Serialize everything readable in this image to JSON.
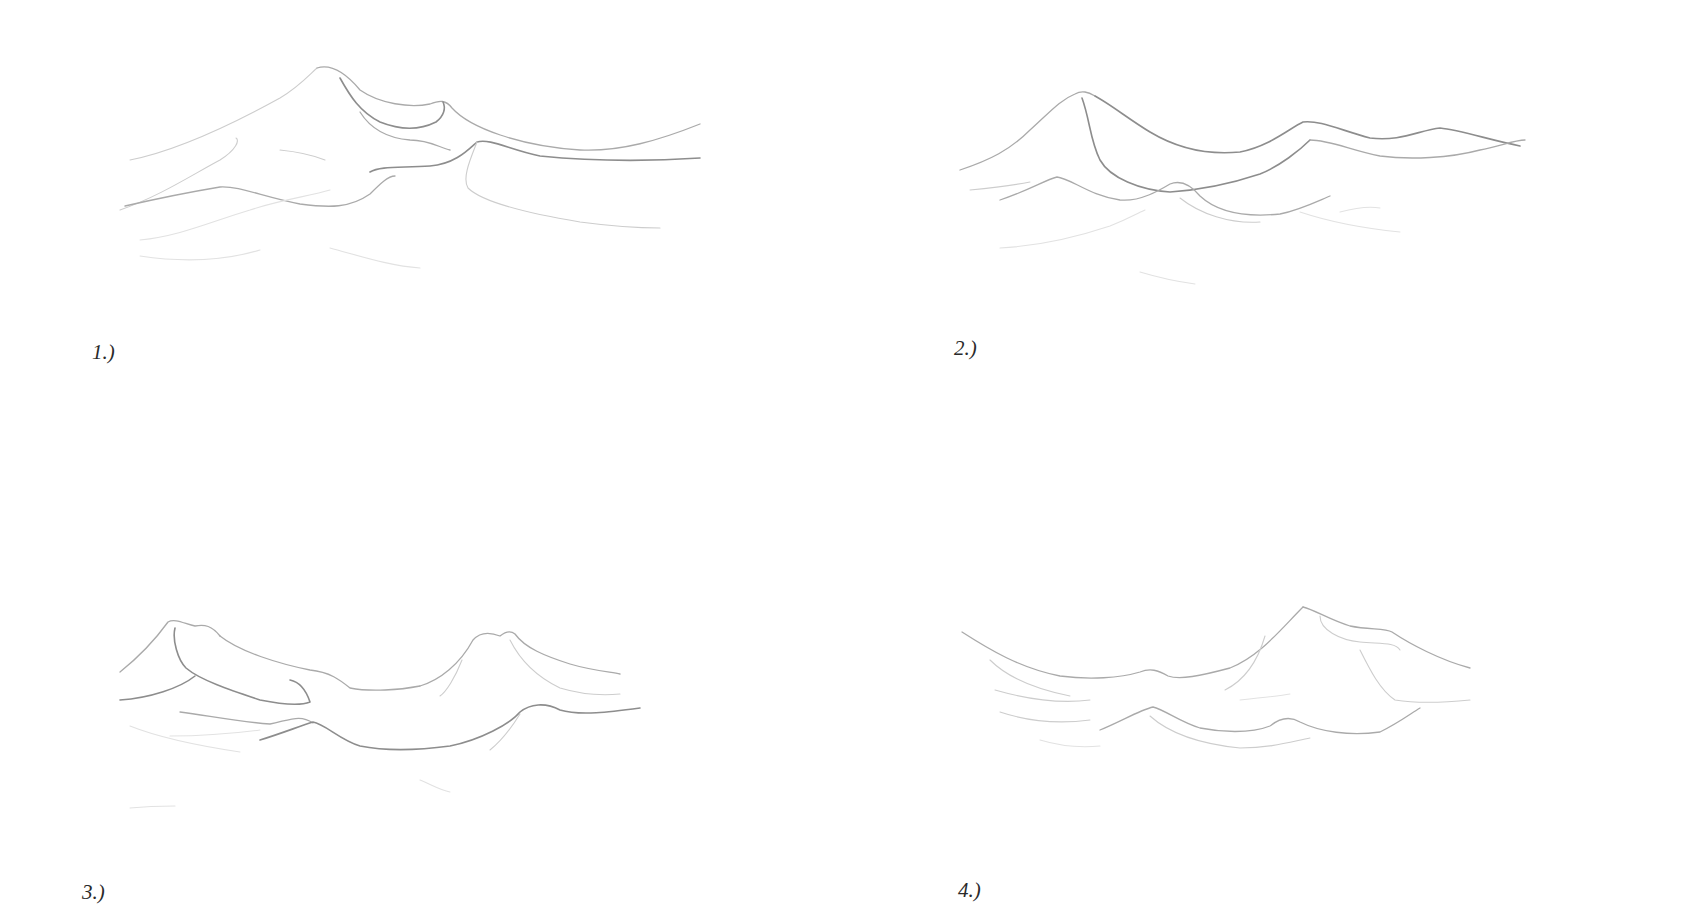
{
  "page": {
    "background": "#ffffff"
  },
  "steps": [
    {
      "label": "1.)",
      "description": "Single tall peak with secondary ridge and foothills"
    },
    {
      "label": "2.)",
      "description": "Multi-peak ridge line with layered lower hills"
    },
    {
      "label": "3.)",
      "description": "Two peaks flanking a valley with central low hill"
    },
    {
      "label": "4.)",
      "description": "Rising ridge to a right-side peak with foreground hills"
    }
  ],
  "colors": {
    "pencil_dark": "#8d8d8d",
    "pencil_mid": "#aaaaaa",
    "pencil_light": "#cdcdcd",
    "label_text": "#2a2a2a"
  }
}
